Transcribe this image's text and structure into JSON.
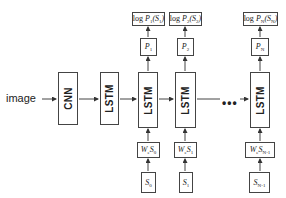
{
  "input_label": "image",
  "encoder": {
    "cnn_label": "CNN",
    "lstm_label": "LSTM"
  },
  "ellipsis": "•••",
  "steps": [
    {
      "lstm_label": "LSTM",
      "loss": {
        "prefix": "log",
        "p": "P",
        "p_sub": "1",
        "s": "S",
        "s_sub": "1"
      },
      "prob": {
        "p": "P",
        "sub": "1"
      },
      "embed": {
        "w": "W",
        "w_sub": "e",
        "s": "S",
        "s_sub": "0"
      },
      "input": {
        "s": "S",
        "sub": "0"
      }
    },
    {
      "lstm_label": "LSTM",
      "loss": {
        "prefix": "log",
        "p": "P",
        "p_sub": "2",
        "s": "S",
        "s_sub": "2"
      },
      "prob": {
        "p": "P",
        "sub": "2"
      },
      "embed": {
        "w": "W",
        "w_sub": "e",
        "s": "S",
        "s_sub": "1"
      },
      "input": {
        "s": "S",
        "sub": "1"
      }
    },
    {
      "lstm_label": "LSTM",
      "loss": {
        "prefix": "log",
        "p": "P",
        "p_sub": "N",
        "s": "S",
        "s_sub": "N"
      },
      "prob": {
        "p": "P",
        "sub": "N"
      },
      "embed": {
        "w": "W",
        "w_sub": "e",
        "s": "S",
        "s_sub": "N-1"
      },
      "input": {
        "s": "S",
        "sub": "N-1"
      }
    }
  ],
  "colors": {
    "line": "#444444",
    "text": "#222222",
    "background": "#ffffff"
  }
}
